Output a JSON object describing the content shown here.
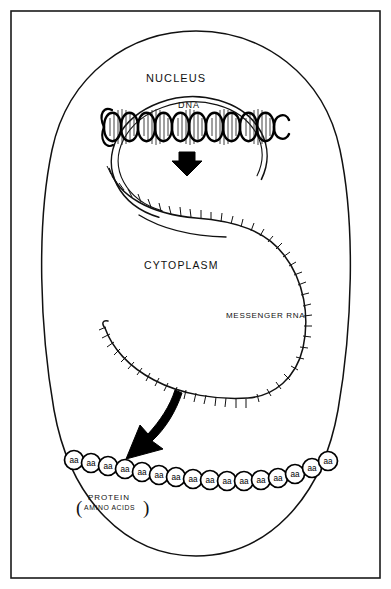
{
  "diagram": {
    "frame": {
      "border_color": "#1a1a1a",
      "background": "#ffffff"
    },
    "labels": {
      "nucleus": "NUCLEUS",
      "dna": "DNA",
      "cytoplasm": "CYTOPLASM",
      "messenger_rna": "MESSENGER RNA",
      "protein": "PROTEIN",
      "amino_acids": "AMINO ACIDS",
      "paren_open": "(",
      "paren_close": ")"
    },
    "structures": {
      "cell_membrane": {
        "name": "cell-membrane",
        "style": "outline-oval",
        "stroke": "#111111"
      },
      "nuclear_membrane": {
        "name": "nuclear-membrane",
        "style": "open-circle-double-line",
        "stroke": "#111111"
      },
      "dna_helix": {
        "name": "dna-double-helix",
        "turns": 5,
        "stroke": "#000000",
        "fill": "#ffffff"
      },
      "messenger_rna": {
        "name": "messenger-rna-strand",
        "style": "toothed-ribbon",
        "stroke": "#111111"
      },
      "transcription_arrow": {
        "name": "transcription-arrow",
        "direction": "down",
        "fill": "#000000"
      },
      "translation_arrow": {
        "name": "translation-arrow",
        "direction": "down-left",
        "fill": "#000000"
      }
    },
    "protein_chain": {
      "residue_label": "aa",
      "count": 16,
      "circle_fill": "#ffffff",
      "circle_stroke": "#000000",
      "residues": [
        {
          "cx": 74,
          "cy": 460,
          "r": 9.5
        },
        {
          "cx": 91,
          "cy": 463,
          "r": 9.5
        },
        {
          "cx": 108,
          "cy": 466,
          "r": 9.5
        },
        {
          "cx": 125,
          "cy": 469,
          "r": 9.5
        },
        {
          "cx": 142,
          "cy": 472,
          "r": 9.5
        },
        {
          "cx": 159,
          "cy": 475,
          "r": 9.5
        },
        {
          "cx": 176,
          "cy": 477,
          "r": 9.5
        },
        {
          "cx": 193,
          "cy": 479,
          "r": 9.5
        },
        {
          "cx": 210,
          "cy": 480,
          "r": 9.5
        },
        {
          "cx": 227,
          "cy": 481,
          "r": 9.5
        },
        {
          "cx": 244,
          "cy": 481,
          "r": 9.5
        },
        {
          "cx": 261,
          "cy": 480,
          "r": 9.5
        },
        {
          "cx": 278,
          "cy": 478,
          "r": 9.5
        },
        {
          "cx": 295,
          "cy": 474,
          "r": 9.5
        },
        {
          "cx": 312,
          "cy": 468,
          "r": 9.5
        },
        {
          "cx": 328,
          "cy": 461,
          "r": 9.5
        }
      ]
    }
  }
}
